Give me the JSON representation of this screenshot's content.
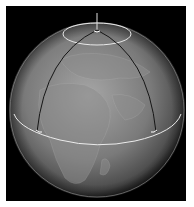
{
  "figure": {
    "colors": {
      "background": "#000000",
      "globe_light": "#a8a8a8",
      "globe_mid": "#6a6a6a",
      "globe_dark": "#1e1e1e",
      "meridian_lines": "#1a1a1a",
      "equator_and_polar_circle": "#e8e8e8"
    },
    "elements": [
      "globe",
      "equator",
      "polar-circle",
      "meridian-left",
      "meridian-right",
      "axis-line",
      "vertex-marks"
    ]
  }
}
